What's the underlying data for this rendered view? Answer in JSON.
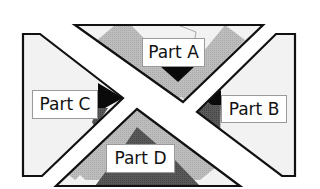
{
  "diagram": {
    "type": "quilt-block-assembly",
    "parts": [
      {
        "id": "A",
        "label": "Part A",
        "position": "top"
      },
      {
        "id": "B",
        "label": "Part B",
        "position": "right"
      },
      {
        "id": "C",
        "label": "Part C",
        "position": "left"
      },
      {
        "id": "D",
        "label": "Part D",
        "position": "bottom"
      }
    ],
    "colors": {
      "outline": "#111111",
      "background_fabric": "#f2f2f2",
      "light_gray_fabric": "#b8b8b8",
      "medium_gray_fabric": "#9a9a9a",
      "dark_gray_fabric": "#555555",
      "black_fabric": "#0a0a0a",
      "label_bg": "#ffffff"
    }
  }
}
